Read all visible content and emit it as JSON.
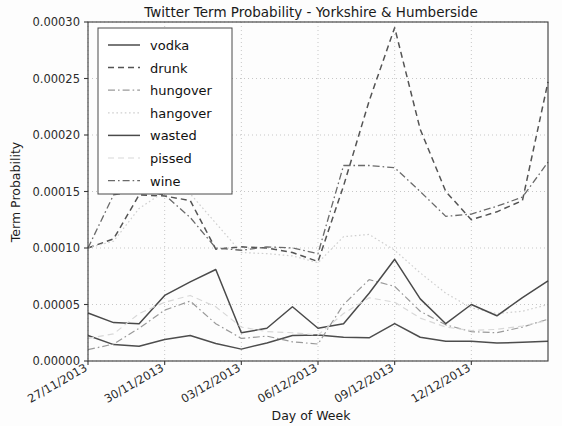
{
  "chart_data": {
    "type": "line",
    "title": "Twitter Term Probability - Yorkshire & Humberside",
    "xlabel": "Day of Week",
    "ylabel": "Term Probability",
    "grid": true,
    "legend_position": "upper left",
    "ylim": [
      0.0,
      0.0003
    ],
    "ytick_labels": [
      "0.00000",
      "0.00005",
      "0.00010",
      "0.00015",
      "0.00020",
      "0.00025",
      "0.00030"
    ],
    "ytick_values": [
      0.0,
      5e-05,
      0.0001,
      0.00015,
      0.0002,
      0.00025,
      0.0003
    ],
    "x": [
      0,
      1,
      2,
      3,
      4,
      5,
      6,
      7,
      8,
      9,
      10,
      11,
      12,
      13,
      14,
      15,
      16,
      17,
      18
    ],
    "xlim": [
      0,
      18
    ],
    "xtick_values": [
      0,
      3,
      6,
      9,
      12,
      15
    ],
    "xtick_labels": [
      "27/11/2013",
      "30/11/2013",
      "03/12/2013",
      "06/12/2013",
      "09/12/2013",
      "12/12/2013"
    ],
    "series": [
      {
        "name": "vodka",
        "style": "solid",
        "color": "#4d4d4d",
        "width": 1.5,
        "values": [
          2.25e-05,
          1.45e-05,
          1.3e-05,
          1.9e-05,
          2.25e-05,
          1.55e-05,
          1.05e-05,
          1.6e-05,
          2.25e-05,
          2.3e-05,
          2.1e-05,
          2.05e-05,
          3.3e-05,
          2.1e-05,
          1.75e-05,
          1.75e-05,
          1.6e-05,
          1.65e-05,
          1.75e-05
        ]
      },
      {
        "name": "drunk",
        "style": "dashed",
        "color": "#545454",
        "width": 1.5,
        "values": [
          0.0001,
          0.000108,
          0.000147,
          0.000146,
          0.000142,
          9.9e-05,
          0.000101,
          0.0001,
          9.6e-05,
          8.8e-05,
          0.000155,
          0.00023,
          0.000295,
          0.000205,
          0.00015,
          0.000125,
          0.000132,
          0.000142,
          0.000247
        ]
      },
      {
        "name": "hungover",
        "style": "dashdot",
        "color": "#9a9a9a",
        "width": 1.2,
        "values": [
          1e-05,
          1.5e-05,
          2.9e-05,
          4.5e-05,
          5.3e-05,
          3.3e-05,
          2e-05,
          2.2e-05,
          1.7e-05,
          1.5e-05,
          5e-05,
          7.2e-05,
          6.6e-05,
          4.4e-05,
          3.2e-05,
          2.6e-05,
          2.5e-05,
          3e-05,
          3.7e-05
        ]
      },
      {
        "name": "hangover",
        "style": "dotted",
        "color": "#cfcfcf",
        "width": 1.2,
        "values": [
          0.0001,
          0.000106,
          0.000135,
          0.00015,
          0.000148,
          0.000122,
          9.6e-05,
          9.5e-05,
          9.3e-05,
          8.7e-05,
          0.00011,
          0.000112,
          9.8e-05,
          7.8e-05,
          6e-05,
          4.7e-05,
          4.2e-05,
          4.4e-05,
          5e-05
        ]
      },
      {
        "name": "wasted",
        "style": "solid",
        "color": "#4a4a4a",
        "width": 1.5,
        "values": [
          4.25e-05,
          3.4e-05,
          3.3e-05,
          5.8e-05,
          7e-05,
          8.1e-05,
          2.5e-05,
          2.9e-05,
          4.8e-05,
          2.9e-05,
          3.3e-05,
          6e-05,
          9e-05,
          5.5e-05,
          3.3e-05,
          5e-05,
          4e-05,
          5.6e-05,
          7.1e-05
        ]
      },
      {
        "name": "pissed",
        "style": "dashed",
        "color": "#d8d8d8",
        "width": 1.2,
        "values": [
          2e-05,
          2.4e-05,
          4.2e-05,
          5.2e-05,
          5.8e-05,
          4.8e-05,
          3e-05,
          2.6e-05,
          2.5e-05,
          2.3e-05,
          4.2e-05,
          5.6e-05,
          5.2e-05,
          3.8e-05,
          3e-05,
          2.7e-05,
          2.8e-05,
          3.1e-05,
          3.6e-05
        ]
      },
      {
        "name": "wine",
        "style": "dashdot",
        "color": "#6a6a6a",
        "width": 1.3,
        "values": [
          0.0001,
          0.000147,
          0.000151,
          0.000147,
          0.000127,
          0.0001,
          9.8e-05,
          0.000101,
          0.0001,
          9.5e-05,
          0.000173,
          0.000173,
          0.000171,
          0.00015,
          0.000128,
          0.00013,
          0.000137,
          0.000145,
          0.000176
        ]
      }
    ]
  },
  "legend": {
    "entries": [
      "vodka",
      "drunk",
      "hungover",
      "hangover",
      "wasted",
      "pissed",
      "wine"
    ]
  }
}
